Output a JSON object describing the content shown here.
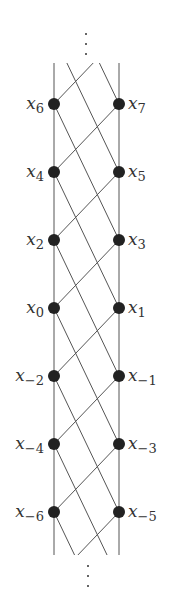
{
  "left_labels": [
    "x6",
    "x4",
    "x2",
    "x0",
    "x−2",
    "x−4",
    "x−6"
  ],
  "left_nodes": [
    {
      "base": "x",
      "sub": "6"
    },
    {
      "base": "x",
      "sub": "4"
    },
    {
      "base": "x",
      "sub": "2"
    },
    {
      "base": "x",
      "sub": "0"
    },
    {
      "base": "x",
      "sub": "−2"
    },
    {
      "base": "x",
      "sub": "−4"
    },
    {
      "base": "x",
      "sub": "−6"
    }
  ],
  "right_nodes": [
    {
      "base": "x",
      "sub": "7"
    },
    {
      "base": "x",
      "sub": "5"
    },
    {
      "base": "x",
      "sub": "3"
    },
    {
      "base": "x",
      "sub": "1"
    },
    {
      "base": "x",
      "sub": "−1"
    },
    {
      "base": "x",
      "sub": "−3"
    },
    {
      "base": "x",
      "sub": "−5"
    }
  ],
  "ellipsis": "⋮"
}
